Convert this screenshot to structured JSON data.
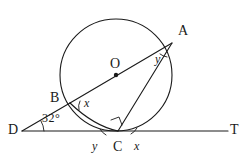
{
  "figure": {
    "kind": "circle-geometry-diagram"
  },
  "points": {
    "A": {
      "label": "A",
      "x": 172,
      "y": 43,
      "label_x": 178,
      "label_y": 24
    },
    "B": {
      "label": "B",
      "x": 70,
      "y": 103,
      "label_x": 50,
      "label_y": 91
    },
    "C": {
      "label": "C",
      "x": 118,
      "y": 131,
      "label_x": 113,
      "label_y": 140
    },
    "D": {
      "label": "D",
      "x": 22,
      "y": 131,
      "label_x": 8,
      "label_y": 123
    },
    "O": {
      "label": "O",
      "x": 116,
      "y": 75,
      "label_x": 110,
      "label_y": 57
    },
    "T": {
      "label": "T",
      "x": 228,
      "y": 131,
      "label_x": 230,
      "label_y": 123
    }
  },
  "circle": {
    "cx": 116,
    "cy": 75,
    "r": 56
  },
  "lines": {
    "tangent_DT": {
      "from": "D",
      "to": "T"
    },
    "diameter_BA_through_O": {
      "from": "B",
      "to": "A"
    },
    "chord_CA": {
      "from": "C",
      "to": "A"
    },
    "segment_DB": {
      "from": "D",
      "to": "B"
    },
    "chord_BC": {
      "from": "B",
      "to": "C"
    }
  },
  "angles": [
    {
      "name": "angle-at-D",
      "text": "32°",
      "vertex": "D",
      "label_x": 42,
      "label_y": 112
    },
    {
      "name": "angle-x-at-B",
      "text": "x",
      "vertex": "B",
      "label_x": 84,
      "label_y": 97
    },
    {
      "name": "angle-y-at-A",
      "text": "y",
      "vertex": "A",
      "label_x": 155,
      "label_y": 53
    },
    {
      "name": "angle-y-at-C-left",
      "text": "y",
      "vertex": "C",
      "label_x": 92,
      "label_y": 140
    },
    {
      "name": "angle-x-at-C-right",
      "text": "x",
      "vertex": "C",
      "label_x": 134,
      "label_y": 140
    }
  ],
  "marks": {
    "right_angle_at_C": "right-angle-square",
    "centre_dot": "filled-dot"
  },
  "colors": {
    "ink": "#1a1a1a",
    "paper": "#ffffff"
  }
}
